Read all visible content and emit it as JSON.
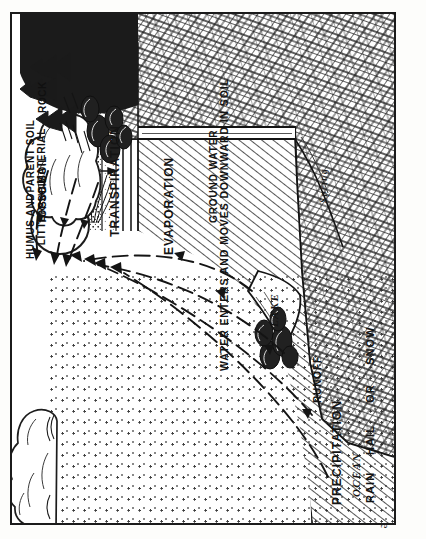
{
  "plate": {
    "title": "Water cycle / hydrologic cycle cross-section diagram",
    "credit": "United States Forest Service",
    "border_color": "#1b1b1b",
    "background": "#ffffff",
    "ink": "#141414"
  },
  "labels": {
    "precipitation": "PRECIPITATION",
    "rain": "RAIN",
    "hail": "HAIL",
    "or": "OR",
    "snow": "SNOW",
    "evaporation": "EVAPORATION",
    "transpiration": "TRANSPIRATION",
    "runoff": "RUNOFF",
    "infiltration": "WATER ENTERS AND MOVES DOWNWARD IN SOIL",
    "ground_water": "GROUND WATER",
    "lake": "LAKE",
    "spring": "Spring",
    "ocean": "OCEAN"
  },
  "soil_profile": {
    "heading": "Soil horizons, top to bottom",
    "layers": [
      {
        "label": "HUMUS AND\nLITTER",
        "pattern": "mottled-dark-specks"
      },
      {
        "label": "TOPSOIL",
        "pattern": "fine-stipple-with-roots"
      },
      {
        "label": "SUB SOIL",
        "pattern": "sparse-stipple-roots"
      },
      {
        "label": "PARENT SOIL\nMATERIAL",
        "pattern": "horizontal-lines"
      },
      {
        "label": "ROCK",
        "pattern": "crystalline-crosshatch"
      }
    ]
  },
  "features": {
    "cloud_rain": "rain-cloud",
    "cloud_evap": "evaporation-cloud",
    "sun": "sun-disc",
    "forest": "forest-trees",
    "shrubs": "shrubs",
    "lake_body": "lake",
    "ocean_body": "ocean",
    "spring_outlet": "spring",
    "arrows_evaporation_count": 4,
    "arrows_transpiration_count": 3
  }
}
